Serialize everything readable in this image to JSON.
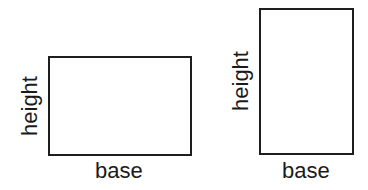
{
  "figures": [
    {
      "name": "wide-rectangle",
      "height_label": "height",
      "base_label": "base"
    },
    {
      "name": "tall-rectangle",
      "height_label": "height",
      "base_label": "base"
    }
  ]
}
